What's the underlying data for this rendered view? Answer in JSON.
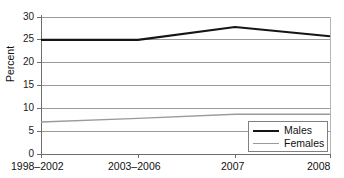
{
  "chart_data": {
    "type": "line",
    "title": "",
    "xlabel": "",
    "ylabel": "Percent",
    "categories": [
      "1998–2002",
      "2003–2006",
      "2007",
      "2008"
    ],
    "series": [
      {
        "name": "Males",
        "values": [
          25.0,
          25.0,
          27.8,
          25.8
        ],
        "color": "#151515"
      },
      {
        "name": "Females",
        "values": [
          7.0,
          7.8,
          8.7,
          8.7
        ],
        "color": "#9a9a9a"
      }
    ],
    "ylim": [
      0,
      30
    ],
    "yticks": [
      0,
      5,
      10,
      15,
      20,
      25,
      30
    ],
    "ytick_labels": [
      "0",
      "5",
      "10",
      "15",
      "20",
      "25",
      "30"
    ],
    "grid": true,
    "legend_position": "bottom-right"
  },
  "axes": {
    "y_title": "Percent",
    "y_ticks": [
      {
        "value": 30,
        "label": "30"
      },
      {
        "value": 25,
        "label": "25"
      },
      {
        "value": 20,
        "label": "20"
      },
      {
        "value": 15,
        "label": "15"
      },
      {
        "value": 10,
        "label": "10"
      },
      {
        "value": 5,
        "label": "5"
      },
      {
        "value": 0,
        "label": "0"
      }
    ],
    "x_ticks": [
      {
        "label": "1998–2002"
      },
      {
        "label": "2003–2006"
      },
      {
        "label": "2007"
      },
      {
        "label": "2008"
      }
    ]
  },
  "legend": {
    "items": [
      {
        "label": "Males"
      },
      {
        "label": "Females"
      }
    ]
  },
  "colors": {
    "males_line": "#151515",
    "females_line": "#9a9a9a",
    "gridline": "#9a9a9a",
    "axis": "#6d6d6d",
    "background": "#ffffff"
  }
}
